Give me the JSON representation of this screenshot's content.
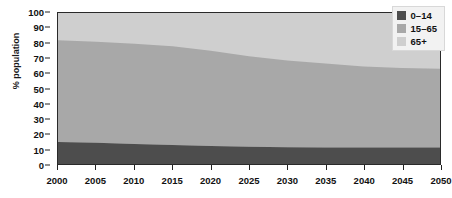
{
  "chart_data": {
    "type": "area",
    "stacked": true,
    "title": "",
    "subtitle": "",
    "xlabel": "",
    "ylabel": "% population",
    "xlim": [
      2000,
      2050
    ],
    "ylim": [
      0,
      100
    ],
    "grid": false,
    "legend_position": "top-right inside plot",
    "x": [
      2000,
      2005,
      2010,
      2015,
      2020,
      2025,
      2030,
      2035,
      2040,
      2045,
      2050
    ],
    "xticks": [
      "2000",
      "2005",
      "2010",
      "2015",
      "2020",
      "2025",
      "2030",
      "2035",
      "2040",
      "2045",
      "2050"
    ],
    "yticks": [
      "0",
      "10",
      "20",
      "30",
      "40",
      "50",
      "60",
      "70",
      "80",
      "90",
      "100"
    ],
    "ytick_values": [
      0,
      10,
      20,
      30,
      40,
      50,
      60,
      70,
      80,
      90,
      100
    ],
    "series": [
      {
        "name": "0–14",
        "color": "#4d4d4d",
        "values": [
          14.5,
          14.0,
          13.3,
          12.6,
          12.0,
          11.4,
          11.1,
          11.0,
          11.0,
          11.0,
          11.0
        ]
      },
      {
        "name": "15–65",
        "color": "#a8a8a8",
        "values": [
          67.5,
          67.0,
          66.3,
          65.4,
          63.0,
          60.0,
          57.5,
          55.5,
          53.5,
          52.5,
          52.0
        ]
      },
      {
        "name": "65+",
        "color": "#cfcfcf",
        "values": [
          18.0,
          19.0,
          20.4,
          22.0,
          25.0,
          28.6,
          31.4,
          33.5,
          35.5,
          36.5,
          37.0
        ]
      }
    ],
    "cumulative_top_boundaries": {
      "0-14_top": [
        14.5,
        14.0,
        13.3,
        12.6,
        12.0,
        11.4,
        11.1,
        11.0,
        11.0,
        11.0,
        11.0
      ],
      "15-65_top": [
        82.0,
        81.0,
        79.6,
        78.0,
        75.0,
        71.4,
        68.6,
        66.5,
        64.5,
        63.5,
        63.0
      ]
    }
  },
  "legend": {
    "items": [
      {
        "label": "0–14",
        "color": "#4d4d4d"
      },
      {
        "label": "15–65",
        "color": "#a8a8a8"
      },
      {
        "label": "65+",
        "color": "#cfcfcf"
      }
    ]
  },
  "axes": {
    "y_title": "% population"
  },
  "colors": {
    "plot_border": "#2a2a2a",
    "background": "#ffffff",
    "legend_bg": "#f2f2f2",
    "tick_text": "#111111"
  }
}
